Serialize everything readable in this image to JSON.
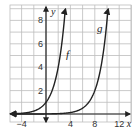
{
  "chart_data": {
    "type": "line",
    "title": "",
    "xlabel": "x",
    "ylabel": "y",
    "xlim": [
      -5.8,
      13.6
    ],
    "ylim": [
      -0.7,
      9.3
    ],
    "grid": true,
    "x_ticks": [
      -4,
      4,
      8,
      12
    ],
    "x_tick_labels": [
      "−4",
      "4",
      "8",
      "12"
    ],
    "y_ticks": [
      2,
      4,
      6,
      8
    ],
    "y_tick_labels": [
      "2",
      "4",
      "6",
      "8"
    ],
    "series": [
      {
        "name": "f",
        "label": "f",
        "formula": "2^x",
        "x": [
          -5,
          -4,
          -3,
          -2,
          -1,
          0,
          1,
          2,
          3
        ],
        "values": [
          0.03,
          0.06,
          0.13,
          0.25,
          0.5,
          1,
          2,
          4,
          8
        ]
      },
      {
        "name": "g",
        "label": "g",
        "formula": "2^(x-7)",
        "x": [
          2,
          3,
          4,
          5,
          6,
          7,
          8,
          9,
          10
        ],
        "values": [
          0.03,
          0.06,
          0.13,
          0.25,
          0.5,
          1,
          2,
          4,
          8
        ]
      }
    ],
    "colors": {
      "curve": "#222222",
      "grid": "#bdbdbd",
      "axis": "#222222"
    }
  }
}
